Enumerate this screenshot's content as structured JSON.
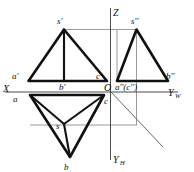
{
  "figure": {
    "colors": {
      "outline": "#111111",
      "axis": "#4a4a4a",
      "construction": "#9a9a9a",
      "miter": "#6a6a6a",
      "background": "#ffffff"
    }
  },
  "axes": {
    "x_label": "X",
    "z_label": "Z",
    "yw_label": "Y",
    "yw_sub": "W",
    "yh_label": "Y",
    "yh_sub": "H",
    "origin_label": "O"
  },
  "front_view": {
    "name": "V-projection",
    "apex_label": "s'",
    "left_label": "a'",
    "right_label": "c'",
    "bottom_label": "b'"
  },
  "side_view": {
    "name": "W-projection",
    "apex_label": "s''",
    "right_label": "b''",
    "coincident_label": "a''(c'')"
  },
  "top_view": {
    "name": "H-projection",
    "left_label": "a",
    "right_label": "c",
    "center_label": "s",
    "bottom_label": "b"
  }
}
